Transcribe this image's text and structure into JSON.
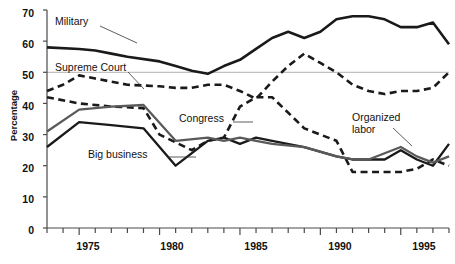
{
  "chart_data": {
    "type": "line",
    "title": "",
    "xlabel": "",
    "ylabel": "Percentage",
    "xlim": [
      1973,
      1998
    ],
    "ylim": [
      0,
      70
    ],
    "ytick_labels": [
      "0",
      "10",
      "20",
      "30",
      "40",
      "50",
      "60",
      "70"
    ],
    "yticks": [
      0,
      10,
      20,
      30,
      40,
      50,
      60,
      70
    ],
    "xtick_labels": [
      "1975",
      "1980",
      "1985",
      "1990",
      "1995"
    ],
    "xticks_major": [
      1975,
      1980,
      1985,
      1990,
      1995
    ],
    "xticks_minor_every": 1,
    "grid": "single horizontal reference line at 50",
    "gridlines": [
      50
    ],
    "legend": "inline series labels with leader lines",
    "series": [
      {
        "name": "Military",
        "style": "solid",
        "color": "#1a1a1a",
        "width": 2.6,
        "x": [
          1973,
          1975,
          1976,
          1977,
          1978,
          1980,
          1981,
          1982,
          1983,
          1984,
          1985,
          1986,
          1987,
          1988,
          1989,
          1990,
          1991,
          1992,
          1993,
          1994,
          1995,
          1996,
          1997,
          1998
        ],
        "values": [
          58,
          57.5,
          57,
          56,
          55,
          53.5,
          52,
          50.5,
          49.5,
          52,
          54,
          57.5,
          61,
          63,
          61,
          63,
          67,
          68,
          68,
          67,
          64.5,
          64.5,
          66,
          59
        ]
      },
      {
        "name": "Supreme Court",
        "style": "dashed",
        "color": "#1a1a1a",
        "width": 2.6,
        "x": [
          1973,
          1974,
          1975,
          1976,
          1977,
          1978,
          1980,
          1981,
          1982,
          1983,
          1984,
          1985,
          1986,
          1987,
          1988,
          1989,
          1990,
          1991,
          1992,
          1993,
          1994,
          1995,
          1996,
          1997,
          1998
        ],
        "values": [
          44,
          46,
          49,
          48,
          47,
          46,
          45.5,
          45,
          45,
          46,
          46,
          44,
          41.5,
          47,
          52,
          56,
          53,
          50,
          46,
          44,
          43,
          44,
          44,
          45,
          50
        ]
      },
      {
        "name": "Congress",
        "style": "dashed",
        "color": "#1a1a1a",
        "width": 2.6,
        "x": [
          1973,
          1975,
          1977,
          1979,
          1980,
          1982,
          1983,
          1984,
          1985,
          1986,
          1987,
          1989,
          1990,
          1991,
          1992,
          1993,
          1994,
          1995,
          1996,
          1997,
          1998
        ],
        "values": [
          42,
          40,
          39,
          38.5,
          30,
          25,
          28,
          29,
          39,
          42,
          42,
          32,
          30,
          28,
          18,
          18,
          18,
          18,
          19,
          22,
          20
        ]
      },
      {
        "name": "Big business",
        "style": "solid",
        "color": "#1a1a1a",
        "width": 2.3,
        "x": [
          1973,
          1975,
          1977,
          1979,
          1981,
          1983,
          1984,
          1985,
          1986,
          1987,
          1989,
          1991,
          1992,
          1993,
          1994,
          1995,
          1996,
          1997,
          1998
        ],
        "values": [
          26,
          34,
          33,
          32,
          20,
          28,
          29,
          27,
          29,
          28,
          26,
          23,
          22,
          22,
          22,
          25,
          22,
          20,
          27
        ]
      },
      {
        "name": "Organized labor",
        "style": "solid",
        "color": "#5a5a5a",
        "width": 2.3,
        "x": [
          1973,
          1975,
          1977,
          1979,
          1981,
          1983,
          1984,
          1985,
          1986,
          1987,
          1989,
          1991,
          1992,
          1993,
          1994,
          1995,
          1996,
          1997,
          1998
        ],
        "values": [
          31,
          38,
          39,
          39.5,
          28,
          29,
          28,
          29,
          28,
          27,
          26,
          23,
          22,
          22,
          24,
          26,
          23,
          21,
          23
        ]
      }
    ],
    "annotations": [
      {
        "label": "Military",
        "target_series": "Military"
      },
      {
        "label": "Supreme Court",
        "target_series": "Supreme Court"
      },
      {
        "label": "Congress",
        "target_series": "Congress"
      },
      {
        "label": "Big business",
        "target_series": "Big business"
      },
      {
        "label": "Organized labor",
        "target_series": "Organized labor"
      }
    ]
  },
  "labels": {
    "military": "Military",
    "supreme_court": "Supreme Court",
    "congress": "Congress",
    "big_business": "Big business",
    "organized_labor_1": "Organized",
    "organized_labor_2": "labor",
    "y_axis": "Percentage"
  },
  "yticks": {
    "t0": "0",
    "t10": "10",
    "t20": "20",
    "t30": "30",
    "t40": "40",
    "t50": "50",
    "t60": "60",
    "t70": "70"
  },
  "xticks": {
    "x1975": "1975",
    "x1980": "1980",
    "x1985": "1985",
    "x1990": "1990",
    "x1995": "1995"
  },
  "colors": {
    "ink": "#1a1a1a",
    "gray_series": "#5a5a5a",
    "axis": "#4a4a4a",
    "gridline": "#b0b0b0",
    "background": "#ffffff"
  }
}
